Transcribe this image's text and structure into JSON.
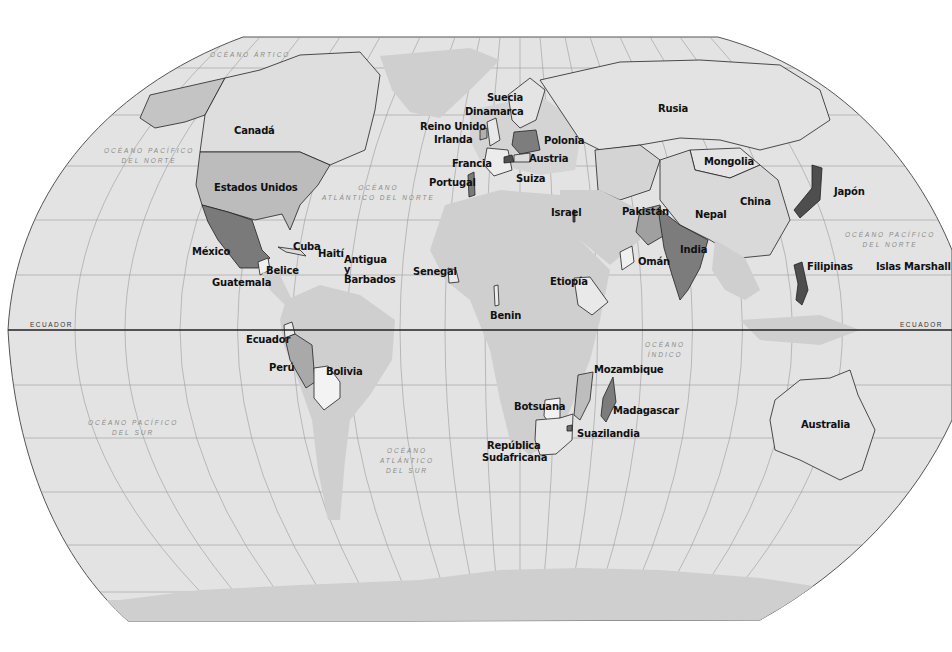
{
  "map": {
    "title": "Mapa del mundo",
    "projection": "Robinson",
    "colors": {
      "ocean": "#e3e3e3",
      "land": "#cfcfcf",
      "land_light": "#dadada",
      "highlight_light": "#f2f2f2",
      "highlight_mid": "#b4b4b4",
      "highlight_dark": "#7a7a7a",
      "highlight_darkest": "#4e4e4e",
      "graticule": "#9a9a9a",
      "equator": "#222222"
    },
    "equator_label_left": "ECUADOR",
    "equator_label_right": "ECUADOR",
    "oceans": [
      {
        "id": "artico",
        "line1": "OCÉANO ÁRTICO",
        "line2": ""
      },
      {
        "id": "pacifico-norte-w",
        "line1": "OCÉANO PACÍFICO",
        "line2": "DEL NORTE"
      },
      {
        "id": "atlantico-norte",
        "line1": "OCÉANO",
        "line2": "ATLÁNTICO DEL NORTE"
      },
      {
        "id": "pacifico-norte-e",
        "line1": "OCÉANO PACÍFICO",
        "line2": "DEL NORTE"
      },
      {
        "id": "indico",
        "line1": "OCÉANO",
        "line2": "ÍNDICO"
      },
      {
        "id": "pacifico-sur",
        "line1": "OCÉANO PACÍFICO",
        "line2": "DEL SUR"
      },
      {
        "id": "atlantico-sur",
        "line1": "OCÉANO",
        "line2": "ATLÁNTICO",
        "line3": "DEL SUR"
      }
    ],
    "countries": [
      {
        "name": "Canadá",
        "shade": "light"
      },
      {
        "name": "Estados Unidos",
        "shade": "mid"
      },
      {
        "name": "México",
        "shade": "dark"
      },
      {
        "name": "Cuba",
        "shade": "light"
      },
      {
        "name": "Haití",
        "shade": "light"
      },
      {
        "name": "Antigua",
        "shade": "light"
      },
      {
        "name": "y",
        "shade": ""
      },
      {
        "name": "Barbados",
        "shade": "light"
      },
      {
        "name": "Belice",
        "shade": "dark"
      },
      {
        "name": "Guatemala",
        "shade": "light"
      },
      {
        "name": "Ecuador",
        "shade": "light"
      },
      {
        "name": "Perú",
        "shade": "mid"
      },
      {
        "name": "Bolivia",
        "shade": "light"
      },
      {
        "name": "Suecia",
        "shade": "light"
      },
      {
        "name": "Dinamarca",
        "shade": "mid"
      },
      {
        "name": "Reino Unido",
        "shade": "light"
      },
      {
        "name": "Irlanda",
        "shade": "mid"
      },
      {
        "name": "Polonia",
        "shade": "dark"
      },
      {
        "name": "Francia",
        "shade": "light"
      },
      {
        "name": "Austria",
        "shade": "light"
      },
      {
        "name": "Suiza",
        "shade": "darkest"
      },
      {
        "name": "Portugal",
        "shade": "dark"
      },
      {
        "name": "Rusia",
        "shade": "light"
      },
      {
        "name": "Mongolia",
        "shade": "light"
      },
      {
        "name": "China",
        "shade": "light"
      },
      {
        "name": "Japón",
        "shade": "darkest"
      },
      {
        "name": "Pakistán",
        "shade": "mid"
      },
      {
        "name": "Nepal",
        "shade": "light"
      },
      {
        "name": "India",
        "shade": "dark"
      },
      {
        "name": "Israel",
        "shade": "darkest"
      },
      {
        "name": "Omán",
        "shade": "light"
      },
      {
        "name": "Filipinas",
        "shade": "darkest"
      },
      {
        "name": "Islas Marshall",
        "shade": "light"
      },
      {
        "name": "Senegal",
        "shade": "light"
      },
      {
        "name": "Benin",
        "shade": "light"
      },
      {
        "name": "Etiopía",
        "shade": "light"
      },
      {
        "name": "Mozambique",
        "shade": "mid"
      },
      {
        "name": "Madagascar",
        "shade": "dark"
      },
      {
        "name": "Botsuana",
        "shade": "light"
      },
      {
        "name": "Suazilandia",
        "shade": "dark"
      },
      {
        "name": "República",
        "shade": "light"
      },
      {
        "name": "Sudafricana",
        "shade": "light"
      },
      {
        "name": "Australia",
        "shade": "light"
      }
    ]
  }
}
